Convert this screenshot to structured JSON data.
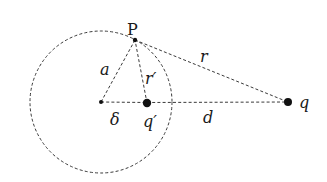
{
  "diagram": {
    "circle": {
      "center": [
        101,
        102
      ],
      "radius": 71,
      "style": "dashed"
    },
    "points": {
      "P": {
        "x": 135,
        "y": 40,
        "label": "P"
      },
      "center": {
        "x": 101,
        "y": 102
      },
      "q_image": {
        "x": 147,
        "y": 103,
        "label": "q′"
      },
      "q": {
        "x": 288,
        "y": 102,
        "label": "q"
      }
    },
    "segments": [
      {
        "from": "center",
        "to": "P",
        "label": "a"
      },
      {
        "from": "q_image",
        "to": "P",
        "label": "r′"
      },
      {
        "from": "P",
        "to": "q",
        "label": "r"
      },
      {
        "from": "center",
        "to": "q_image",
        "label": "δ"
      },
      {
        "from": "q_image",
        "to": "q",
        "label": "d"
      }
    ],
    "labels": {
      "P": "P",
      "a": "a",
      "r_prime": "r′",
      "r": "r",
      "delta": "δ",
      "q_prime": "q′",
      "d": "d",
      "q": "q"
    }
  }
}
